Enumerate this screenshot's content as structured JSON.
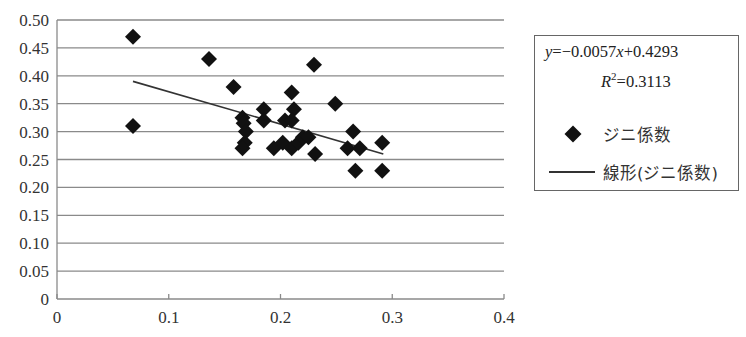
{
  "chart_data": {
    "type": "scatter",
    "title": "",
    "xlabel": "",
    "ylabel": "",
    "xlim": [
      0,
      0.4
    ],
    "ylim": [
      0,
      0.5
    ],
    "x_ticks": [
      "0",
      "0.1",
      "0.2",
      "0.3",
      "0.4"
    ],
    "y_ticks": [
      "0",
      "0.05",
      "0.10",
      "0.15",
      "0.20",
      "0.25",
      "0.30",
      "0.35",
      "0.40",
      "0.45",
      "0.50"
    ],
    "grid": {
      "horizontal": true,
      "vertical": false
    },
    "legend_position": "right",
    "series": [
      {
        "name": "ジニ係数",
        "kind": "scatter",
        "marker": "diamond",
        "color": "#111111",
        "points": [
          [
            0.068,
            0.47
          ],
          [
            0.068,
            0.31
          ],
          [
            0.136,
            0.43
          ],
          [
            0.158,
            0.38
          ],
          [
            0.166,
            0.325
          ],
          [
            0.167,
            0.315
          ],
          [
            0.169,
            0.3
          ],
          [
            0.168,
            0.28
          ],
          [
            0.166,
            0.27
          ],
          [
            0.185,
            0.34
          ],
          [
            0.185,
            0.32
          ],
          [
            0.194,
            0.27
          ],
          [
            0.202,
            0.28
          ],
          [
            0.204,
            0.32
          ],
          [
            0.21,
            0.37
          ],
          [
            0.212,
            0.34
          ],
          [
            0.21,
            0.32
          ],
          [
            0.21,
            0.27
          ],
          [
            0.216,
            0.28
          ],
          [
            0.22,
            0.29
          ],
          [
            0.225,
            0.29
          ],
          [
            0.231,
            0.26
          ],
          [
            0.23,
            0.42
          ],
          [
            0.249,
            0.35
          ],
          [
            0.26,
            0.27
          ],
          [
            0.265,
            0.3
          ],
          [
            0.271,
            0.27
          ],
          [
            0.267,
            0.23
          ],
          [
            0.291,
            0.28
          ],
          [
            0.291,
            0.23
          ]
        ]
      },
      {
        "name": "線形(ジニ係数)",
        "kind": "line",
        "color": "#333333",
        "points": [
          [
            0.068,
            0.39
          ],
          [
            0.292,
            0.26
          ]
        ]
      }
    ],
    "annotations": {
      "equation": "y=−0.0057x+0.4293",
      "r_squared": "R²=0.3113"
    }
  },
  "legend": {
    "equation_prefix": "y",
    "equation_mid": "=−0.0057",
    "equation_x": "x",
    "equation_suffix": "+0.4293",
    "r2_label": "R",
    "r2_sup": "2",
    "r2_value": "=0.3113",
    "series_label": "ジニ係数",
    "trend_label": "線形(ジニ係数)"
  }
}
